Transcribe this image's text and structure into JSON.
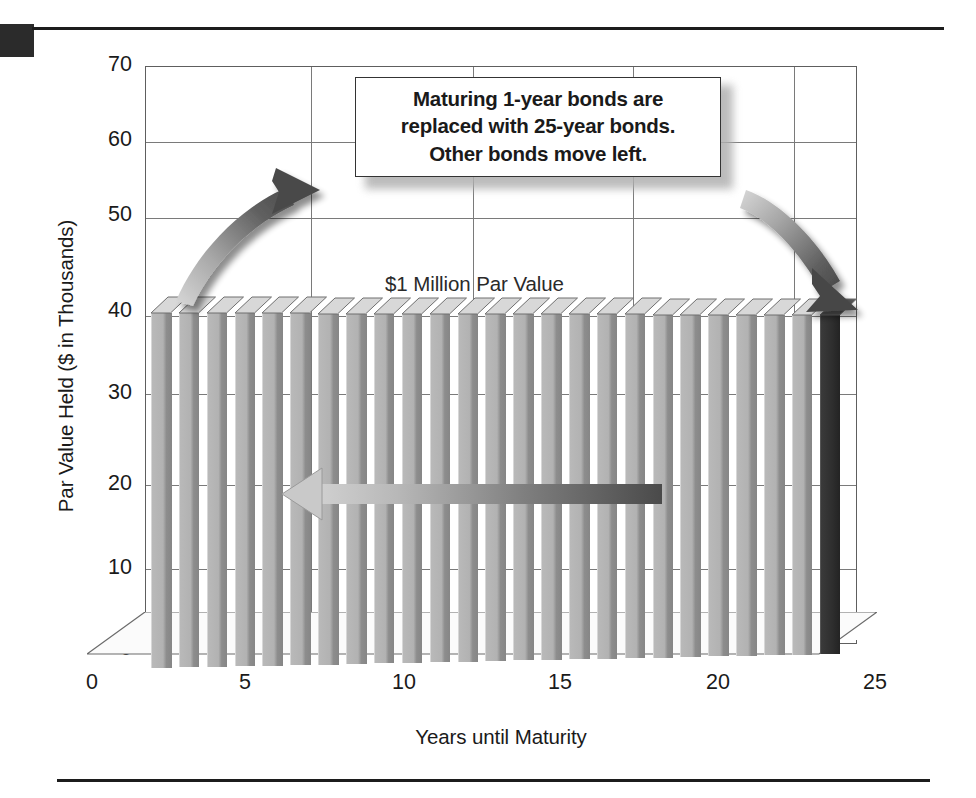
{
  "chart_data": {
    "type": "bar",
    "title": "",
    "subtitle": "",
    "xlabel": "Years until Maturity",
    "ylabel": "Par Value Held ($ in Thousands)",
    "xlim": [
      0,
      25.8
    ],
    "ylim": [
      0,
      70
    ],
    "xticks": [
      0,
      5,
      10,
      15,
      20,
      25
    ],
    "xtick_labels": [
      "0",
      "5",
      "10",
      "15",
      "20",
      "25"
    ],
    "yticks": [
      0,
      10,
      20,
      30,
      40,
      50,
      60,
      70
    ],
    "ytick_labels": [
      "0",
      "10",
      "20",
      "30",
      "40",
      "50",
      "60",
      "70"
    ],
    "grid": "horizontal-and-vertical at 10-unit y and 5-unit x",
    "legend": "none",
    "legend_position": "none",
    "three_d": true,
    "categories": [
      1,
      2,
      3,
      4,
      5,
      6,
      7,
      8,
      9,
      10,
      11,
      12,
      13,
      14,
      15,
      16,
      17,
      18,
      19,
      20,
      21,
      22,
      23,
      24,
      25
    ],
    "values": [
      40,
      40,
      40,
      40,
      40,
      40,
      40,
      40,
      40,
      40,
      40,
      40,
      40,
      40,
      40,
      40,
      40,
      40,
      40,
      40,
      40,
      40,
      40,
      40,
      40
    ],
    "series": [
      {
        "name": "Par Value Held",
        "values": [
          40,
          40,
          40,
          40,
          40,
          40,
          40,
          40,
          40,
          40,
          40,
          40,
          40,
          40,
          40,
          40,
          40,
          40,
          40,
          40,
          40,
          40,
          40,
          40,
          40
        ]
      }
    ],
    "highlighted_category": 25,
    "highlight_color": "#2b2b2b",
    "bar_color": "#ababab",
    "annotations": [
      {
        "name": "par-value-label",
        "text": "$1 Million Par Value",
        "x": 11,
        "y": 42
      },
      {
        "name": "callout-box",
        "text": "Maturing 1-year bonds are replaced with 25-year bonds. Other bonds move left.",
        "lines": [
          "Maturing 1-year bonds are",
          "replaced with 25-year bonds.",
          "Other bonds move left."
        ]
      },
      {
        "name": "left-curved-arrow",
        "description": "curved arrow rising to the right toward the callout"
      },
      {
        "name": "right-curved-arrow",
        "description": "curved arrow descending to the right toward the 25-year bar"
      },
      {
        "name": "shift-left-arrow",
        "description": "horizontal arrow pointing left across the bars",
        "y": 18
      }
    ]
  },
  "axes": {
    "y_title": "Par Value Held ($ in Thousands)",
    "x_title": "Years until Maturity",
    "y_ticks": [
      {
        "label": "70",
        "value": 70
      },
      {
        "label": "60",
        "value": 60
      },
      {
        "label": "50",
        "value": 50
      },
      {
        "label": "40",
        "value": 40
      },
      {
        "label": "30",
        "value": 30
      },
      {
        "label": "20",
        "value": 20
      },
      {
        "label": "10",
        "value": 10
      },
      {
        "label": "0",
        "value": 0
      }
    ],
    "x_ticks": [
      {
        "label": "0",
        "value": 0
      },
      {
        "label": "5",
        "value": 5
      },
      {
        "label": "10",
        "value": 10
      },
      {
        "label": "15",
        "value": 15
      },
      {
        "label": "20",
        "value": 20
      },
      {
        "label": "25",
        "value": 25
      }
    ]
  },
  "callout": {
    "line1": "Maturing 1-year bonds are",
    "line2": "replaced with 25-year bonds.",
    "line3": "Other bonds move left."
  },
  "labels": {
    "par_value": "$1 Million Par Value"
  },
  "colors": {
    "bar": "#ababab",
    "bar_shadow": "#868686",
    "bar_top": "#d2d2d2",
    "highlight": "#2b2b2b",
    "grid": "#7a7a7a",
    "frame": "#5e5e5e",
    "text": "#1a1a1a",
    "rule": "#1c1c1c",
    "arrow": "#6a6a6a"
  }
}
